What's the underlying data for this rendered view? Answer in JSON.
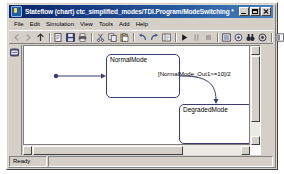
{
  "window": {
    "title": "Stateflow (chart) ctc_simplified_modes/TDI.Program/ModeSwitching *",
    "icon": "stateflow-icon",
    "controls": {
      "minimize": "Minimize",
      "maximize": "Maximize",
      "close": "Close"
    }
  },
  "menu": {
    "items": [
      {
        "label": "File"
      },
      {
        "label": "Edit"
      },
      {
        "label": "Simulation"
      },
      {
        "label": "View"
      },
      {
        "label": "Tools"
      },
      {
        "label": "Add"
      },
      {
        "label": "Help"
      }
    ]
  },
  "toolbar": {
    "groups": [
      {
        "buttons": [
          {
            "name": "back-icon",
            "glyph": "arrow-left",
            "enabled": false
          },
          {
            "name": "forward-icon",
            "glyph": "arrow-right",
            "enabled": false
          },
          {
            "name": "up-to-parent-icon",
            "glyph": "arrow-up",
            "enabled": true
          }
        ]
      },
      {
        "buttons": [
          {
            "name": "new-model-icon",
            "glyph": "page",
            "enabled": true
          },
          {
            "name": "save-icon",
            "glyph": "floppy",
            "enabled": true
          },
          {
            "name": "print-icon",
            "glyph": "printer",
            "enabled": true
          }
        ]
      },
      {
        "buttons": [
          {
            "name": "cut-icon",
            "glyph": "scissors",
            "enabled": true
          },
          {
            "name": "copy-icon",
            "glyph": "copy",
            "enabled": true
          },
          {
            "name": "paste-icon",
            "glyph": "clipboard",
            "enabled": true
          }
        ]
      },
      {
        "buttons": [
          {
            "name": "undo-icon",
            "glyph": "undo",
            "enabled": true
          },
          {
            "name": "redo-icon",
            "glyph": "redo",
            "enabled": true
          },
          {
            "name": "model-explorer-icon",
            "glyph": "explorer",
            "enabled": true
          }
        ]
      },
      {
        "buttons": [
          {
            "name": "start-simulation-icon",
            "glyph": "play",
            "enabled": true
          },
          {
            "name": "pause-simulation-icon",
            "glyph": "pause",
            "enabled": false
          },
          {
            "name": "stop-simulation-icon",
            "glyph": "stop",
            "enabled": false
          }
        ]
      },
      {
        "buttons": [
          {
            "name": "build-icon",
            "glyph": "build",
            "enabled": true
          },
          {
            "name": "debug-icon",
            "glyph": "debug",
            "enabled": true
          },
          {
            "name": "find-icon",
            "glyph": "binoculars",
            "enabled": true
          },
          {
            "name": "coverage-icon",
            "glyph": "target",
            "enabled": true
          }
        ]
      },
      {
        "buttons": [
          {
            "name": "data-explorer-icon",
            "glyph": "datatable",
            "enabled": true
          }
        ]
      }
    ]
  },
  "palette": {
    "tools": [
      {
        "name": "state-tool",
        "glyph": "state"
      },
      {
        "name": "history-junction-tool",
        "glyph": "history"
      },
      {
        "name": "default-transition-tool",
        "glyph": "default-transition"
      },
      {
        "name": "connective-junction-tool",
        "glyph": "junction"
      },
      {
        "name": "truth-table-tool",
        "glyph": "truthtable"
      },
      {
        "name": "function-tool",
        "glyph": "function"
      },
      {
        "name": "embedded-function-tool",
        "glyph": "embedded"
      }
    ]
  },
  "chart": {
    "states": [
      {
        "id": "normal-mode",
        "label": "NormalMode",
        "x": 82,
        "y": 8,
        "width": 74,
        "height": 44
      },
      {
        "id": "degraded-mode",
        "label": "DegradedMode",
        "x": 155,
        "y": 58,
        "width": 74,
        "height": 40
      }
    ],
    "transitions": [
      {
        "id": "default-transition",
        "label": "",
        "type": "default"
      },
      {
        "id": "normal-to-degraded",
        "label": "[NormalMode_Out1>=10]/2",
        "label_x": 134,
        "label_y": 25,
        "type": "conditional"
      }
    ]
  },
  "status": {
    "message": "Ready",
    "secondary": ""
  }
}
